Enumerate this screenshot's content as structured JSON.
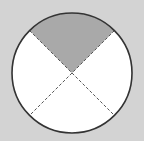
{
  "diagram": {
    "type": "fraction-circle",
    "parts": 4,
    "shaded_parts": 1,
    "fraction_shaded": "1/4",
    "colors": {
      "background": "#d3d3d3",
      "circle_fill": "#ffffff",
      "shaded_fill": "#a9a9a9",
      "outline": "#333333",
      "divider": "#555555"
    }
  }
}
